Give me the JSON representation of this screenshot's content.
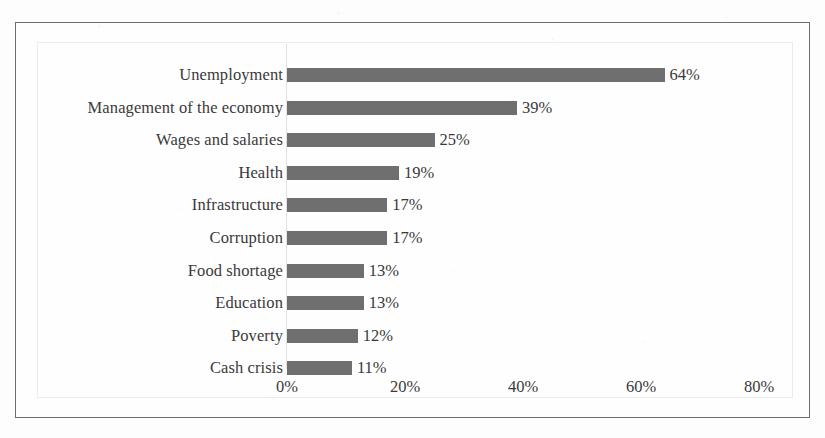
{
  "chart_data": {
    "type": "bar",
    "orientation": "horizontal",
    "title": "",
    "subtitle": "",
    "xlabel": "",
    "ylabel": "",
    "categories": [
      "Unemployment",
      "Management of the economy",
      "Wages and salaries",
      "Health",
      "Infrastructure",
      "Corruption",
      "Food shortage",
      "Education",
      "Poverty",
      "Cash crisis"
    ],
    "values": [
      64,
      39,
      25,
      19,
      17,
      17,
      13,
      13,
      12,
      11
    ],
    "data_labels": [
      "64%",
      "39%",
      "25%",
      "19%",
      "17%",
      "17%",
      "13%",
      "13%",
      "12%",
      "11%"
    ],
    "xlim": [
      0,
      80
    ],
    "x_ticks": [
      0,
      20,
      40,
      60,
      80
    ],
    "x_tick_labels": [
      "0%",
      "20%",
      "40%",
      "60%",
      "80%"
    ],
    "grid": false,
    "legend": false,
    "legend_position": "none",
    "series": [
      {
        "name": "",
        "values": [
          64,
          39,
          25,
          19,
          17,
          17,
          13,
          13,
          12,
          11
        ]
      }
    ]
  },
  "style": {
    "bar_color": "#6f6f6f",
    "text_color": "#3a3a3a",
    "frame_color": "#6e6e6e",
    "plot_border_color": "#ececec",
    "axis_line_color": "#e2e2e2",
    "background": "#fefefe"
  }
}
